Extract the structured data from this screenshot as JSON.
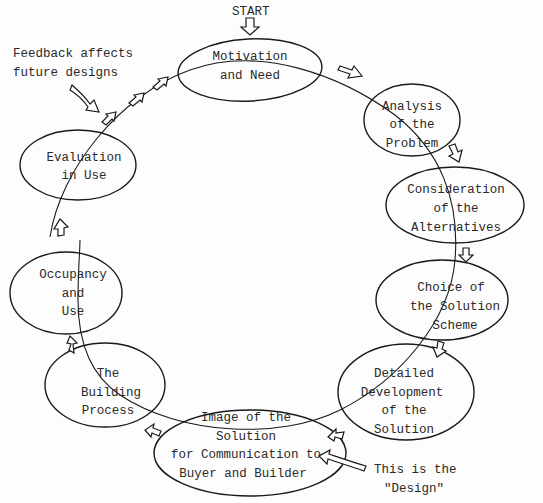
{
  "diagram": {
    "start_label": "START",
    "nodes": [
      {
        "id": "motivation",
        "lines": [
          "Motivation",
          "and Need"
        ]
      },
      {
        "id": "analysis",
        "lines": [
          "Analysis",
          "of the",
          "Problem"
        ]
      },
      {
        "id": "alternatives",
        "lines": [
          "Consideration",
          "of the",
          "Alternatives"
        ]
      },
      {
        "id": "choice",
        "lines": [
          "Choice of",
          "the Solution",
          "Scheme"
        ]
      },
      {
        "id": "detailed",
        "lines": [
          "Detailed",
          "Development",
          "of the",
          "Solution"
        ]
      },
      {
        "id": "image",
        "lines": [
          "Image of the",
          "Solution",
          "for Communication to",
          "Buyer and Builder"
        ]
      },
      {
        "id": "building",
        "lines": [
          "The",
          "Building",
          "Process"
        ]
      },
      {
        "id": "occupancy",
        "lines": [
          "Occupancy",
          "and",
          "Use"
        ]
      },
      {
        "id": "evaluation",
        "lines": [
          "Evaluation",
          "in Use"
        ]
      }
    ],
    "annotations": {
      "feedback": [
        "Feedback affects",
        "future designs"
      ],
      "design": [
        "This is the",
        "\"Design\""
      ]
    },
    "colors": {
      "stroke": "#1a1a1a",
      "text": "#2a2a2a",
      "background": "#fdfdfd"
    }
  }
}
